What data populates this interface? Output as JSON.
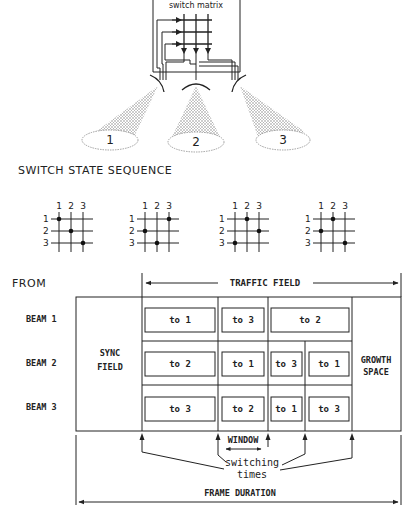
{
  "top_diagram": {
    "switch_matrix_label": "switch matrix",
    "beams": [
      {
        "label": "1"
      },
      {
        "label": "2"
      },
      {
        "label": "3"
      }
    ]
  },
  "switch_state_sequence": {
    "title": "SWITCH STATE SEQUENCE",
    "column_labels": [
      "1",
      "2",
      "3"
    ],
    "row_labels": [
      "1",
      "2",
      "3"
    ],
    "states": [
      {
        "connections": [
          [
            1,
            1
          ],
          [
            2,
            2
          ],
          [
            3,
            3
          ]
        ]
      },
      {
        "connections": [
          [
            1,
            3
          ],
          [
            2,
            1
          ],
          [
            3,
            2
          ]
        ]
      },
      {
        "connections": [
          [
            1,
            2
          ],
          [
            2,
            3
          ],
          [
            3,
            1
          ]
        ]
      },
      {
        "connections": [
          [
            1,
            2
          ],
          [
            2,
            1
          ],
          [
            3,
            3
          ]
        ]
      }
    ]
  },
  "frame": {
    "from_label": "FROM",
    "traffic_field_label": "TRAFFIC FIELD",
    "sync_field_label_line1": "SYNC",
    "sync_field_label_line2": "FIELD",
    "growth_label_line1": "GROWTH",
    "growth_label_line2": "SPACE",
    "rows": [
      {
        "label": "BEAM 1",
        "bursts": [
          "to 1",
          "to 3",
          "to 2"
        ]
      },
      {
        "label": "BEAM 2",
        "bursts": [
          "to 2",
          "to 1",
          "to 3",
          "to 1"
        ]
      },
      {
        "label": "BEAM 3",
        "bursts": [
          "to 3",
          "to 2",
          "to 1",
          "to 3"
        ]
      }
    ],
    "window_label": "WINDOW",
    "switching_label_line1": "switching",
    "switching_label_line2": "times",
    "frame_duration_label": "FRAME DURATION"
  }
}
